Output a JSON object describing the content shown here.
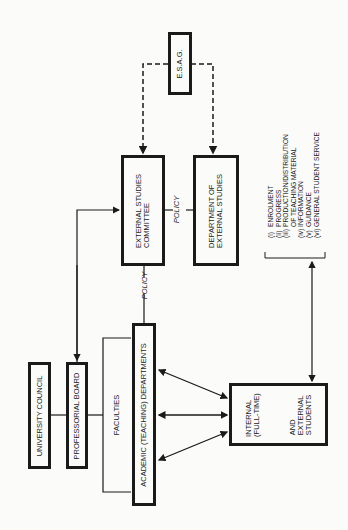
{
  "diagram": {
    "nodes": {
      "esag": "E.S.A.G.",
      "external_studies_committee": [
        "EXTERNAL STUDIES",
        "COMMITTEE"
      ],
      "department_external_studies": [
        "DEPARTMENT OF",
        "EXTERNAL STUDIES"
      ],
      "university_council": "UNIVERSITY COUNCIL",
      "professorial_board": "PROFESSORIAL BOARD",
      "faculties": "FACULTIES",
      "academic_departments": "ACADEMIC (TEACHING) DEPARTMENTS",
      "students_internal": [
        "INTERNAL",
        "(FULL-TIME)"
      ],
      "students_external": [
        "AND",
        "EXTERNAL",
        "STUDENTS"
      ]
    },
    "edge_labels": {
      "policy_top": "POLICY",
      "policy_bottom": "POLICY"
    },
    "services_list": [
      {
        "numeral": "(i)",
        "text": "ENROLMENT"
      },
      {
        "numeral": "(ii)",
        "text": "PROGRESS"
      },
      {
        "numeral": "(iii)",
        "text": "PRODUCTION/DISTRIBUTION"
      },
      {
        "numeral": "",
        "text": "OF TEACHING MATERIAL"
      },
      {
        "numeral": "(iv)",
        "text": "INFORMATION"
      },
      {
        "numeral": "(v)",
        "text": "GUIDANCE"
      },
      {
        "numeral": "(vi)",
        "text": "GENERAL STUDENT SERVICE"
      }
    ]
  }
}
